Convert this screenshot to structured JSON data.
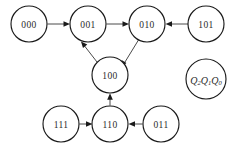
{
  "diagram": {
    "nodes": [
      {
        "id": "s000",
        "label": "000",
        "cx": 29,
        "cy": 24,
        "r": 18
      },
      {
        "id": "s001",
        "label": "001",
        "cx": 88,
        "cy": 24,
        "r": 18
      },
      {
        "id": "s010",
        "label": "010",
        "cx": 147,
        "cy": 24,
        "r": 18
      },
      {
        "id": "s101",
        "label": "101",
        "cx": 206,
        "cy": 24,
        "r": 18
      },
      {
        "id": "s100",
        "label": "100",
        "cx": 110,
        "cy": 75,
        "r": 18
      },
      {
        "id": "s111",
        "label": "111",
        "cx": 61,
        "cy": 124,
        "r": 18
      },
      {
        "id": "s110",
        "label": "110",
        "cx": 110,
        "cy": 124,
        "r": 18
      },
      {
        "id": "s011",
        "label": "011",
        "cx": 161,
        "cy": 124,
        "r": 18
      }
    ],
    "legend": {
      "id": "qlabel",
      "cx": 206,
      "cy": 79,
      "r": 20,
      "text": "Q2Q1Q0",
      "parts": [
        {
          "main": "Q",
          "sub": "2"
        },
        {
          "main": "Q",
          "sub": "1"
        },
        {
          "main": "Q",
          "sub": "0"
        }
      ]
    },
    "edges": [
      {
        "id": "e-000-001",
        "from": "000",
        "to": "001",
        "direction": "right"
      },
      {
        "id": "e-001-010",
        "from": "001",
        "to": "010",
        "direction": "right"
      },
      {
        "id": "e-101-010",
        "from": "101",
        "to": "010",
        "direction": "left"
      },
      {
        "id": "e-010-100",
        "from": "010",
        "to": "100",
        "direction": "down-left"
      },
      {
        "id": "e-100-001",
        "from": "100",
        "to": "001",
        "direction": "up-left"
      },
      {
        "id": "e-110-100",
        "from": "110",
        "to": "100",
        "direction": "up"
      },
      {
        "id": "e-111-110",
        "from": "111",
        "to": "110",
        "direction": "right"
      },
      {
        "id": "e-011-110",
        "from": "011",
        "to": "110",
        "direction": "left"
      }
    ],
    "colors": {
      "node_stroke": "#1a1a1a",
      "node_fill": "#ffffff",
      "edge_stroke": "#4a4a4a",
      "text": "#2b2b2b",
      "background": "#ffffff"
    }
  }
}
